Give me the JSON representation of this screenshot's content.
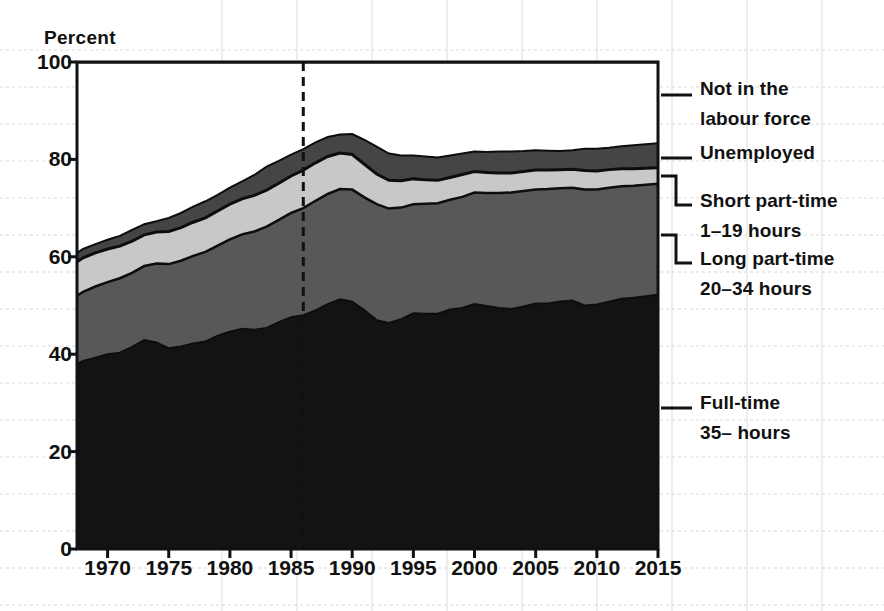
{
  "chart_data": {
    "type": "area",
    "stacked": true,
    "title": "",
    "subtitle": "",
    "xlabel": "",
    "ylabel": "Percent",
    "ylim": [
      0,
      100
    ],
    "xlim": [
      1967.5,
      2015
    ],
    "grid": true,
    "grid_interval": 5,
    "legend_position": "right-outside",
    "y_ticks": [
      0,
      20,
      40,
      60,
      80,
      100
    ],
    "y_tick_labels": [
      "0",
      "20",
      "40",
      "60",
      "80",
      "100"
    ],
    "x_ticks": [
      1970,
      1975,
      1980,
      1985,
      1990,
      1995,
      2000,
      2005,
      2010,
      2015
    ],
    "x_tick_labels": [
      "1970",
      "1975",
      "1980",
      "1985",
      "1990",
      "1995",
      "2000",
      "2005",
      "2010",
      "2015"
    ],
    "annotations": [
      {
        "name": "reference-line",
        "type": "vline",
        "x": 1986,
        "style": "dashed",
        "color": "#111111"
      }
    ],
    "legend": [
      {
        "key": "not_in_labour_force",
        "label_line1": "Not in the",
        "label_line2": "labour force",
        "color": "#ffffff"
      },
      {
        "key": "unemployed",
        "label_line1": "Unemployed",
        "label_line2": "",
        "color": "#454545"
      },
      {
        "key": "short_part_time",
        "label_line1": "Short part-time",
        "label_line2": "1–19 hours",
        "color": "#c8c8c8"
      },
      {
        "key": "long_part_time",
        "label_line1": "Long part-time",
        "label_line2": "20–34 hours",
        "color": "#585858"
      },
      {
        "key": "full_time",
        "label_line1": "Full-time",
        "label_line2": "35– hours",
        "color": "#131313"
      }
    ],
    "x": [
      1967.5,
      1968,
      1969,
      1970,
      1971,
      1972,
      1973,
      1974,
      1975,
      1976,
      1977,
      1978,
      1979,
      1980,
      1981,
      1982,
      1983,
      1984,
      1985,
      1986,
      1987,
      1988,
      1989,
      1990,
      1991,
      1992,
      1993,
      1994,
      1995,
      1996,
      1997,
      1998,
      1999,
      2000,
      2001,
      2002,
      2003,
      2004,
      2005,
      2006,
      2007,
      2008,
      2009,
      2010,
      2011,
      2012,
      2013,
      2014,
      2015
    ],
    "series": [
      {
        "name": "Full-time 35– hours",
        "key": "full_time",
        "color": "#131313",
        "values": [
          38.0,
          38.6,
          39.3,
          40.0,
          40.3,
          41.5,
          42.9,
          42.4,
          41.2,
          41.6,
          42.2,
          42.6,
          43.8,
          44.6,
          45.2,
          45.0,
          45.4,
          46.6,
          47.6,
          48.0,
          49.0,
          50.3,
          51.3,
          50.8,
          49.0,
          47.0,
          46.4,
          47.2,
          48.4,
          48.3,
          48.3,
          49.2,
          49.5,
          50.3,
          49.9,
          49.5,
          49.3,
          49.8,
          50.4,
          50.4,
          50.8,
          51.0,
          50.0,
          50.2,
          50.8,
          51.4,
          51.6,
          51.9,
          52.2
        ]
      },
      {
        "name": "Long part-time 20–34 hours",
        "key": "long_part_time",
        "color": "#585858",
        "values": [
          14.0,
          14.2,
          14.6,
          14.8,
          15.3,
          15.2,
          15.2,
          16.2,
          17.3,
          17.6,
          18.0,
          18.4,
          18.5,
          19.0,
          19.4,
          20.2,
          20.8,
          21.0,
          21.4,
          22.0,
          22.5,
          22.6,
          22.6,
          23.0,
          23.2,
          23.8,
          23.5,
          22.9,
          22.4,
          22.6,
          22.7,
          22.5,
          22.8,
          22.9,
          23.2,
          23.6,
          23.9,
          23.7,
          23.4,
          23.5,
          23.3,
          23.2,
          23.8,
          23.6,
          23.4,
          23.1,
          23.0,
          22.9,
          22.8
        ]
      },
      {
        "name": "Short part-time 1–19 hours",
        "key": "short_part_time",
        "color": "#c8c8c8",
        "values": [
          7.0,
          7.0,
          6.9,
          6.8,
          6.6,
          6.5,
          6.4,
          6.5,
          6.7,
          6.8,
          6.9,
          7.0,
          7.1,
          7.2,
          7.3,
          7.4,
          7.5,
          7.5,
          7.6,
          7.8,
          7.8,
          7.7,
          7.4,
          7.2,
          6.8,
          6.2,
          5.8,
          5.5,
          5.2,
          4.9,
          4.7,
          4.6,
          4.6,
          4.3,
          4.2,
          4.1,
          4.0,
          4.0,
          4.0,
          3.9,
          3.8,
          3.8,
          3.9,
          3.8,
          3.7,
          3.6,
          3.5,
          3.4,
          3.3
        ]
      },
      {
        "name": "Unemployed",
        "key": "unemployed",
        "color": "#454545",
        "values": [
          1.8,
          1.8,
          1.8,
          1.9,
          2.1,
          2.3,
          2.2,
          2.2,
          2.8,
          3.0,
          3.2,
          3.4,
          3.3,
          3.4,
          3.6,
          4.2,
          4.8,
          4.6,
          4.4,
          4.3,
          4.2,
          4.0,
          3.8,
          4.2,
          5.0,
          5.6,
          5.5,
          5.2,
          4.8,
          4.8,
          4.7,
          4.5,
          4.3,
          4.1,
          4.2,
          4.4,
          4.4,
          4.2,
          4.1,
          4.0,
          3.8,
          3.9,
          4.5,
          4.6,
          4.5,
          4.6,
          4.8,
          4.9,
          5.0
        ]
      },
      {
        "name": "Not in the labour force",
        "key": "not_in_labour_force",
        "color": "#ffffff",
        "values": [
          39.2,
          38.4,
          37.4,
          36.5,
          35.7,
          34.5,
          33.3,
          32.7,
          32.0,
          31.0,
          29.7,
          28.6,
          27.3,
          25.8,
          24.5,
          23.2,
          21.5,
          20.3,
          19.0,
          17.9,
          16.5,
          15.4,
          14.9,
          14.8,
          16.0,
          17.4,
          18.8,
          19.2,
          19.2,
          19.4,
          19.6,
          19.2,
          18.8,
          18.4,
          18.5,
          18.4,
          18.4,
          18.3,
          18.1,
          18.2,
          18.3,
          18.1,
          17.8,
          17.8,
          17.6,
          17.3,
          17.1,
          16.9,
          16.7
        ]
      }
    ],
    "cumulative_tops": {
      "note": "Stacked upper boundaries in percent, bottom-to-top",
      "full_time": [
        38.0,
        38.6,
        39.3,
        40.0,
        40.3,
        41.5,
        42.9,
        42.4,
        41.2,
        41.6,
        42.2,
        42.6,
        43.8,
        44.6,
        45.2,
        45.0,
        45.4,
        46.6,
        47.6,
        48.0,
        49.0,
        50.3,
        51.3,
        50.8,
        49.0,
        47.0,
        46.4,
        47.2,
        48.4,
        48.3,
        48.3,
        49.2,
        49.5,
        50.3,
        49.9,
        49.5,
        49.3,
        49.8,
        50.4,
        50.4,
        50.8,
        51.0,
        50.0,
        50.2,
        50.8,
        51.4,
        51.6,
        51.9,
        52.2
      ],
      "plus_long_part_time": [
        52.0,
        52.8,
        53.9,
        54.8,
        55.6,
        56.7,
        58.1,
        58.6,
        58.5,
        59.2,
        60.2,
        61.0,
        62.3,
        63.6,
        64.6,
        65.2,
        66.2,
        67.6,
        69.0,
        70.0,
        71.5,
        72.9,
        73.9,
        73.8,
        72.2,
        70.8,
        69.9,
        70.1,
        70.8,
        70.9,
        71.0,
        71.7,
        72.3,
        73.2,
        73.1,
        73.1,
        73.2,
        73.5,
        73.8,
        73.9,
        74.1,
        74.2,
        73.8,
        73.8,
        74.2,
        74.5,
        74.6,
        74.8,
        75.0
      ],
      "plus_short_part_time": [
        59.0,
        59.8,
        60.8,
        61.6,
        62.2,
        63.2,
        64.5,
        65.1,
        65.2,
        66.0,
        67.1,
        68.0,
        69.4,
        70.8,
        71.9,
        72.6,
        73.7,
        75.1,
        76.6,
        77.8,
        79.3,
        80.6,
        81.3,
        81.0,
        79.0,
        77.0,
        75.7,
        75.6,
        76.0,
        75.8,
        75.7,
        76.3,
        76.9,
        77.5,
        77.3,
        77.2,
        77.2,
        77.5,
        77.8,
        77.8,
        77.9,
        78.0,
        77.7,
        77.6,
        77.9,
        78.1,
        78.1,
        78.2,
        78.3
      ],
      "plus_unemployed": [
        60.8,
        61.6,
        62.6,
        63.5,
        64.3,
        65.5,
        66.7,
        67.3,
        68.0,
        69.0,
        70.3,
        71.4,
        72.7,
        74.2,
        75.5,
        76.8,
        78.5,
        79.7,
        81.0,
        82.1,
        83.5,
        84.6,
        85.1,
        85.2,
        84.0,
        82.6,
        81.2,
        80.8,
        80.8,
        80.6,
        80.4,
        80.8,
        81.2,
        81.6,
        81.5,
        81.6,
        81.6,
        81.7,
        81.9,
        81.8,
        81.7,
        81.9,
        82.2,
        82.2,
        82.4,
        82.7,
        82.9,
        83.1,
        83.3
      ]
    }
  }
}
